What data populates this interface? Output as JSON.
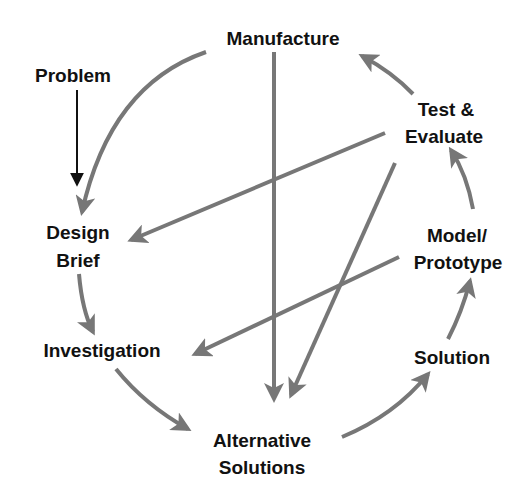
{
  "diagram": {
    "type": "design-process-cycle",
    "colors": {
      "arrow": "#777777",
      "text": "#111111",
      "problem_arrow": "#111111",
      "background": "#ffffff"
    },
    "nodes": {
      "manufacture": {
        "lines": [
          "Manufacture"
        ]
      },
      "problem": {
        "lines": [
          "Problem"
        ]
      },
      "test_evaluate": {
        "lines": [
          "Test &",
          "Evaluate"
        ]
      },
      "design_brief": {
        "lines": [
          "Design",
          "Brief"
        ]
      },
      "model_prototype": {
        "lines": [
          "Model/",
          "Prototype"
        ]
      },
      "investigation": {
        "lines": [
          "Investigation"
        ]
      },
      "solution": {
        "lines": [
          "Solution"
        ]
      },
      "alternative_solutions": {
        "lines": [
          "Alternative",
          "Solutions"
        ]
      }
    },
    "edges": [
      {
        "from": "Problem",
        "to": "Design Brief",
        "style": "black-straight"
      },
      {
        "from": "Manufacture",
        "to": "Design Brief",
        "style": "gray-curved"
      },
      {
        "from": "Design Brief",
        "to": "Investigation",
        "style": "gray-curved"
      },
      {
        "from": "Investigation",
        "to": "Alternative Solutions",
        "style": "gray-curved"
      },
      {
        "from": "Alternative Solutions",
        "to": "Solution",
        "style": "gray-curved"
      },
      {
        "from": "Solution",
        "to": "Model/Prototype",
        "style": "gray-curved"
      },
      {
        "from": "Model/Prototype",
        "to": "Test & Evaluate",
        "style": "gray-curved"
      },
      {
        "from": "Test & Evaluate",
        "to": "Manufacture",
        "style": "gray-curved"
      },
      {
        "from": "Manufacture",
        "to": "Alternative Solutions",
        "style": "gray-straight"
      },
      {
        "from": "Test & Evaluate",
        "to": "Design Brief",
        "style": "gray-straight"
      },
      {
        "from": "Test & Evaluate",
        "to": "Alternative Solutions",
        "style": "gray-straight"
      },
      {
        "from": "Model/Prototype",
        "to": "Investigation",
        "style": "gray-straight"
      }
    ]
  }
}
